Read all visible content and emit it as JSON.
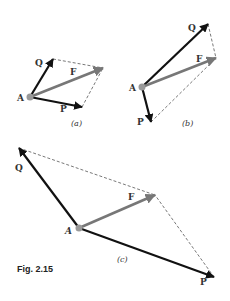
{
  "figure": {
    "caption": "Fig. 2.15",
    "colors": {
      "P": "#111111",
      "Q": "#111111",
      "F": "#777777",
      "dashed": "#555555",
      "origin": "#999999"
    },
    "panels": [
      {
        "id": "a",
        "label": "(a)",
        "origin_label": "A",
        "vectors": {
          "P": "P",
          "Q": "Q",
          "F": "F"
        }
      },
      {
        "id": "b",
        "label": "(b)",
        "origin_label": "A",
        "vectors": {
          "P": "P",
          "Q": "Q",
          "F": "F"
        }
      },
      {
        "id": "c",
        "label": "(c)",
        "origin_label": "A",
        "vectors": {
          "P": "P",
          "Q": "Q",
          "F": "F"
        }
      }
    ]
  }
}
